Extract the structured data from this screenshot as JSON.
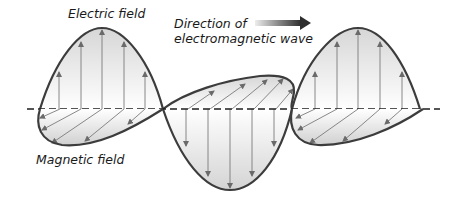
{
  "labels": {
    "electric_field": "Electric field",
    "direction_line1": "Direction of",
    "direction_line2": "electromagnetic wave",
    "magnetic_field": "Magnetic field"
  },
  "colors": {
    "curve_stroke": "#3c3c3c",
    "field_vector": "#7a7a7a",
    "axis": "#1e1e1e",
    "fill_light": "#ffffff",
    "fill_dark": "#d9d9d9",
    "arrow_start": "#e0e0e0",
    "arrow_end": "#333333"
  },
  "diagram": {
    "axis": {
      "x1": 27,
      "x2": 440,
      "y": 109
    },
    "electric_lobes": [
      {
        "x_start": 40,
        "x_end": 163,
        "peak_x": 102,
        "peak_y": 28,
        "direction": "up"
      },
      {
        "x_start": 163,
        "x_end": 292,
        "peak_x": 230,
        "peak_y": 190,
        "direction": "down"
      },
      {
        "x_start": 292,
        "x_end": 420,
        "peak_x": 358,
        "peak_y": 28,
        "direction": "up"
      }
    ],
    "magnetic_lobes": [
      {
        "direction": "front-below"
      },
      {
        "direction": "back-above"
      },
      {
        "direction": "front-below"
      }
    ],
    "direction_arrow": {
      "x1": 255,
      "x2": 310,
      "y": 23
    }
  }
}
